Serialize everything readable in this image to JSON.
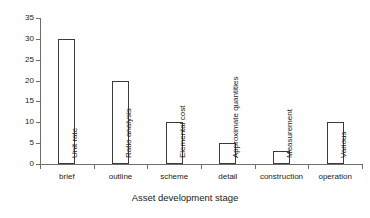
{
  "chart_data": {
    "type": "bar",
    "title": "",
    "xlabel": "Asset development stage",
    "ylabel": "Accuracy/percentile range",
    "categories": [
      "brief",
      "outline",
      "scheme",
      "detail",
      "construction",
      "operation"
    ],
    "values": [
      30,
      20,
      10,
      5,
      3,
      10
    ],
    "bar_labels": [
      "Unit rate",
      "Ratio analysis",
      "Elemental cost",
      "Approximate  quantities",
      "Measurement",
      "Various"
    ],
    "ylim": [
      0,
      35
    ],
    "yticks": [
      0,
      5,
      10,
      15,
      20,
      25,
      30,
      35
    ],
    "ytick_labels": [
      "0",
      "5",
      "10",
      "15",
      "20",
      "25",
      "30",
      "35"
    ],
    "grid": false,
    "legend": "none",
    "bar_fill_color": "#ffffff",
    "bar_border_color": "#3a3a3a",
    "axis_color": "#6e6e6e",
    "text_color": "#1a1a1a",
    "background_color": "#ffffff"
  }
}
